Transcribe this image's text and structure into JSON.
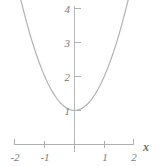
{
  "chart_data": {
    "type": "line",
    "title": "",
    "subtitle": "",
    "xlabel": "x",
    "ylabel": "",
    "equation": "y = x^2 + 1",
    "xlim": [
      -2,
      2
    ],
    "ylim": [
      0,
      4.35
    ],
    "grid": false,
    "legend": null,
    "x_ticks": [
      {
        "value": -2,
        "label": "-2"
      },
      {
        "value": -1,
        "label": "-1"
      },
      {
        "value": 1,
        "label": "1"
      },
      {
        "value": 2,
        "label": "2"
      }
    ],
    "y_ticks": [
      {
        "value": 1,
        "label": "1"
      },
      {
        "value": 2,
        "label": "2"
      },
      {
        "value": 3,
        "label": "3"
      },
      {
        "value": 4,
        "label": "4"
      }
    ],
    "series": [
      {
        "name": "parabola",
        "color": "#b3b3b3",
        "x": [
          -1.82,
          -1.7,
          -1.6,
          -1.5,
          -1.4,
          -1.3,
          -1.2,
          -1.1,
          -1.0,
          -0.9,
          -0.8,
          -0.7,
          -0.6,
          -0.5,
          -0.4,
          -0.3,
          -0.2,
          -0.1,
          0.0,
          0.1,
          0.2,
          0.3,
          0.4,
          0.5,
          0.6,
          0.7,
          0.8,
          0.9,
          1.0,
          1.1,
          1.2,
          1.3,
          1.4,
          1.5,
          1.6,
          1.7,
          1.82
        ],
        "y": [
          4.31,
          3.89,
          3.56,
          3.25,
          2.96,
          2.69,
          2.44,
          2.21,
          2.0,
          1.81,
          1.64,
          1.49,
          1.36,
          1.25,
          1.16,
          1.09,
          1.04,
          1.01,
          1.0,
          1.01,
          1.04,
          1.09,
          1.16,
          1.25,
          1.36,
          1.49,
          1.64,
          1.81,
          2.0,
          2.21,
          2.44,
          2.69,
          2.96,
          3.25,
          3.56,
          3.89,
          4.31
        ]
      }
    ],
    "axis_color": "#b0b0b0",
    "label_color": "#7a7a7a"
  }
}
